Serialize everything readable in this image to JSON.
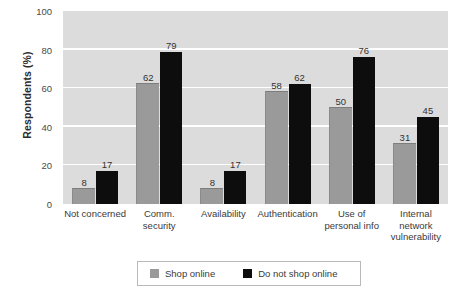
{
  "chart_data": {
    "type": "bar",
    "title": "",
    "xlabel": "",
    "ylabel": "Respondents (%)",
    "ylim": [
      0,
      100
    ],
    "yticks": [
      0,
      20,
      40,
      60,
      80,
      100
    ],
    "grid": true,
    "legend_position": "bottom",
    "categories": [
      "Not concerned",
      "Comm. security",
      "Availability",
      "Authentication",
      "Use of personal info",
      "Internal network vulnerability"
    ],
    "category_lines": [
      [
        "Not concerned"
      ],
      [
        "Comm.",
        "security"
      ],
      [
        "Availability"
      ],
      [
        "Authentication"
      ],
      [
        "Use of",
        "personal info"
      ],
      [
        "Internal",
        "network",
        "vulnerability"
      ]
    ],
    "series": [
      {
        "name": "Shop online",
        "color": "#9a9a9a",
        "values": [
          8,
          62,
          8,
          58,
          50,
          31
        ]
      },
      {
        "name": "Do not shop online",
        "color": "#0d0d0d",
        "values": [
          17,
          79,
          17,
          62,
          76,
          45
        ]
      }
    ]
  },
  "axis": {
    "y_title": "Respondents (%)",
    "y_tick_labels": [
      "0",
      "20",
      "40",
      "60",
      "80",
      "100"
    ]
  },
  "legend": {
    "items": [
      {
        "label": "Shop online",
        "color": "#9a9a9a"
      },
      {
        "label": "Do not shop online",
        "color": "#0d0d0d"
      }
    ]
  },
  "colors": {
    "plot_background": "#dcdcdc",
    "gridline": "#ffffff",
    "shop_online": "#9a9a9a",
    "do_not_shop_online": "#0d0d0d",
    "page_background": "#ffffff"
  }
}
